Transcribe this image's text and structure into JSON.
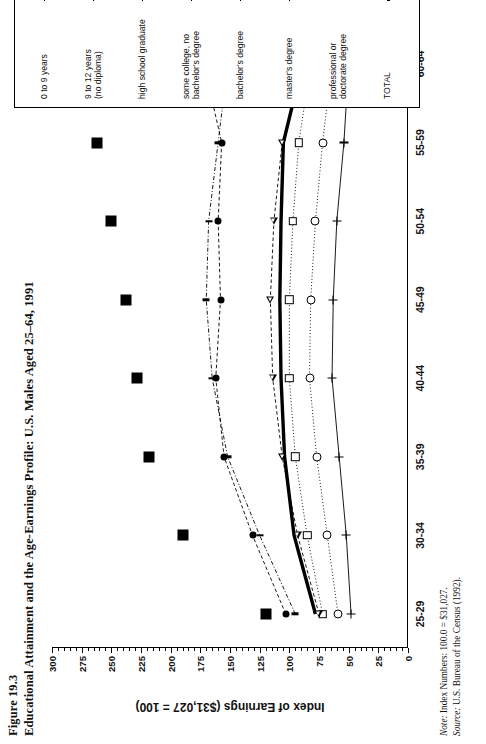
{
  "figure": {
    "number": "Figure 19.3",
    "title": "Educational Attainment and the Age-Earnings Profile: U.S. Males Aged 25–64, 1991",
    "note_label": "Note:",
    "note_text": " Index Numbers: 100.0 = $31,027.",
    "source_label": "Source:",
    "source_text": " U.S. Bureau of the Census (1992)."
  },
  "chart_data": {
    "type": "line",
    "title": "Educational Attainment and the Age-Earnings Profile: U.S. Males Aged 25–64, 1991",
    "xlabel": "",
    "ylabel": "Index of Earnings ($31,027 = 100)",
    "categories": [
      "25-29",
      "30-34",
      "35-39",
      "40-44",
      "45-49",
      "50-54",
      "55-59",
      "60-64"
    ],
    "ylim": [
      0,
      300
    ],
    "yticks": [
      0,
      25,
      50,
      75,
      100,
      125,
      150,
      175,
      200,
      225,
      250,
      275,
      300
    ],
    "ytick_labels": [
      "0",
      "25",
      "50",
      "75",
      "100",
      "125",
      "150",
      "175",
      "200",
      "225",
      "250",
      "275",
      "300"
    ],
    "grid": false,
    "minor_ticks": true,
    "legend_position": "right",
    "orientation": "page rotated 90 degrees counter-clockwise",
    "series": [
      {
        "name": "0 to 9 years",
        "marker": "plus",
        "line": "solid",
        "values": [
          48,
          52,
          58,
          64,
          63,
          60,
          54,
          50
        ]
      },
      {
        "name": "9 to 12 years (no diploma)",
        "marker": "open-circle",
        "line": "dotted",
        "values": [
          59,
          68,
          77,
          83,
          82,
          78,
          72,
          64
        ]
      },
      {
        "name": "high school graduate",
        "marker": "open-square",
        "line": "dotted",
        "values": [
          72,
          85,
          95,
          100,
          100,
          97,
          92,
          82
        ]
      },
      {
        "name": "some college, no bachelor's degree",
        "marker": "open-triangle",
        "line": "dashed",
        "values": [
          75,
          93,
          106,
          114,
          116,
          113,
          106,
          88
        ]
      },
      {
        "name": "bachelor's degree",
        "marker": "dash",
        "line": "dash-dot",
        "values": [
          95,
          125,
          152,
          165,
          170,
          168,
          160,
          152
        ]
      },
      {
        "name": "master's degree",
        "marker": "filled-circle",
        "line": "dashed",
        "values": [
          103,
          131,
          155,
          162,
          158,
          160,
          157,
          172
        ]
      },
      {
        "name": "professional or doctorate degree",
        "marker": "filled-square",
        "line": "none",
        "values": [
          120,
          190,
          218,
          228,
          238,
          250,
          262,
          205
        ]
      },
      {
        "name": "TOTAL",
        "marker": "none",
        "line": "thick-solid",
        "values": [
          78,
          96,
          104,
          107,
          108,
          107,
          105,
          89
        ]
      }
    ]
  },
  "legend": {
    "entries": [
      {
        "label_line1": "0 to 9 years",
        "label_line2": ""
      },
      {
        "label_line1": "9 to 12 years",
        "label_line2": "(no diploma)"
      },
      {
        "label_line1": "high school graduate",
        "label_line2": ""
      },
      {
        "label_line1": "some college, no",
        "label_line2": "bachelor's degree"
      },
      {
        "label_line1": "bachelor's degree",
        "label_line2": ""
      },
      {
        "label_line1": "master's degree",
        "label_line2": ""
      },
      {
        "label_line1": "professional or",
        "label_line2": "doctorate degree"
      },
      {
        "label_line1": "TOTAL",
        "label_line2": ""
      }
    ]
  }
}
